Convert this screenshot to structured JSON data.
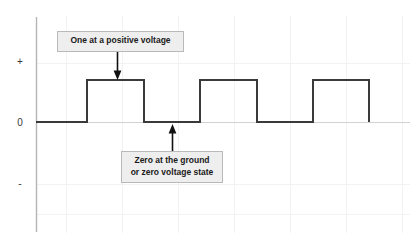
{
  "figure": {
    "background_color": "#ffffff"
  },
  "axis": {
    "labels": {
      "positive": "+",
      "zero": "0",
      "negative": "-"
    },
    "axis_color": "#b0b0b0",
    "baseline_color": "#cccccc",
    "grid_color": "#f1f1f1",
    "grid_visible": true
  },
  "annotations": [
    {
      "id": "one-callout",
      "line1": "One at a positive voltage",
      "line2": "",
      "arrow": "down-arrow-icon",
      "box_fill": "#eeeeee",
      "box_border": "#b9b9b9"
    },
    {
      "id": "zero-callout",
      "line1": "Zero at the ground",
      "line2": "or zero voltage state",
      "arrow": "up-arrow-icon",
      "box_fill": "#eeeeee",
      "box_border": "#b9b9b9"
    }
  ],
  "chart_data": {
    "type": "line",
    "title": "",
    "xlabel": "",
    "ylabel": "",
    "series": [
      {
        "name": "Digital signal",
        "style": "square-wave",
        "color": "#3a3a3a",
        "line_width": 2,
        "bits": [
          0,
          1,
          0,
          1,
          0,
          1
        ],
        "levels": [
          "0",
          "+",
          "0",
          "+",
          "0",
          "+"
        ],
        "x_transitions_px": [
          36,
          87,
          144,
          200,
          257,
          313,
          369
        ],
        "y_low_px": 122,
        "y_high_px": 80,
        "points": [
          {
            "x": 36,
            "y": 0
          },
          {
            "x": 87,
            "y": 0
          },
          {
            "x": 87,
            "y": 1
          },
          {
            "x": 144,
            "y": 1
          },
          {
            "x": 144,
            "y": 0
          },
          {
            "x": 200,
            "y": 0
          },
          {
            "x": 200,
            "y": 1
          },
          {
            "x": 257,
            "y": 1
          },
          {
            "x": 257,
            "y": 0
          },
          {
            "x": 313,
            "y": 0
          },
          {
            "x": 313,
            "y": 1
          },
          {
            "x": 369,
            "y": 1
          },
          {
            "x": 369,
            "y": 0
          }
        ]
      }
    ],
    "yticks": [
      "+",
      "0",
      "-"
    ],
    "ytick_positions_px": [
      63,
      122,
      184
    ],
    "ylim": [
      "-",
      "+"
    ],
    "xticks": [],
    "legend": null,
    "grid": true
  }
}
